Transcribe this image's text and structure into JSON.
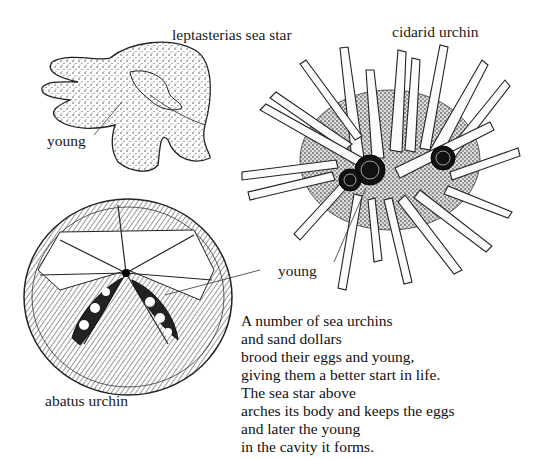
{
  "labels": {
    "sea_star": "leptasterias sea star",
    "sea_star_young": "young",
    "cidarid": "cidarid urchin",
    "urchin_young": "young",
    "abatus": "abatus urchin"
  },
  "caption": {
    "lines": [
      "A number of sea urchins",
      "and sand dollars",
      "brood their eggs and young,",
      "giving them a better start in life.",
      "The sea star above",
      "arches its body and keeps the eggs",
      "and later the young",
      "in the cavity it forms."
    ]
  },
  "colors": {
    "ink": "#1a1a1a",
    "paper": "#ffffff"
  }
}
